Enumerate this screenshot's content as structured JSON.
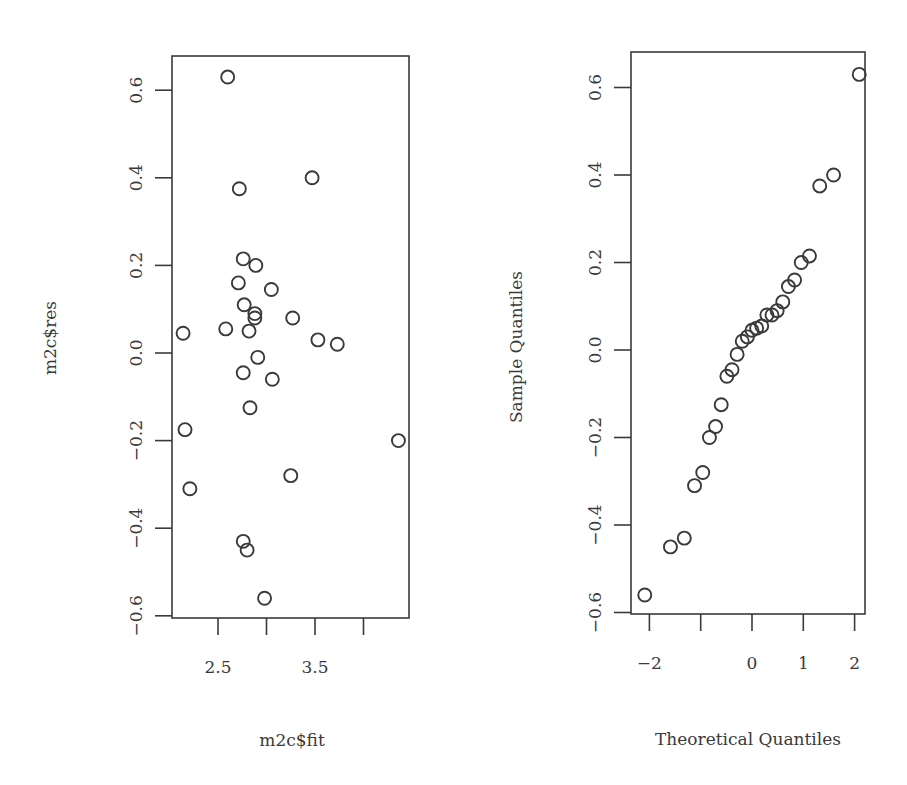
{
  "chart_data": [
    {
      "type": "scatter",
      "title": "",
      "xlabel": "m2c$fit",
      "ylabel": "m2c$res",
      "xlim": [
        2.05,
        4.5
      ],
      "ylim": [
        -0.6,
        0.67
      ],
      "x_ticks": [
        2.5,
        3.0,
        3.5,
        4.0
      ],
      "x_tick_labels": [
        "2.5",
        "",
        "3.5",
        ""
      ],
      "y_ticks": [
        -0.6,
        -0.4,
        -0.2,
        0.0,
        0.2,
        0.4,
        0.6
      ],
      "y_tick_labels": [
        "−0.6",
        "−0.4",
        "−0.2",
        "0.0",
        "0.2",
        "0.4",
        "0.6"
      ],
      "grid": false,
      "marker": "open-circle",
      "x": [
        2.6,
        2.72,
        3.47,
        2.76,
        2.89,
        2.71,
        3.05,
        2.77,
        2.88,
        2.88,
        3.27,
        2.58,
        2.82,
        2.14,
        3.53,
        3.73,
        2.91,
        2.76,
        3.06,
        2.83,
        2.16,
        4.36,
        3.25,
        2.21,
        2.76,
        2.8,
        2.98
      ],
      "y": [
        0.63,
        0.375,
        0.4,
        0.215,
        0.2,
        0.16,
        0.145,
        0.11,
        0.09,
        0.08,
        0.08,
        0.055,
        0.05,
        0.045,
        0.03,
        0.02,
        -0.01,
        -0.045,
        -0.06,
        -0.125,
        -0.175,
        -0.2,
        -0.28,
        -0.31,
        -0.43,
        -0.45,
        -0.56
      ]
    },
    {
      "type": "scatter",
      "title": "",
      "xlabel": "Theoretical Quantiles",
      "ylabel": "Sample Quantiles",
      "xlim": [
        -2.27,
        2.27
      ],
      "ylim": [
        -0.6,
        0.67
      ],
      "x_ticks": [
        -2,
        -1,
        0,
        1,
        2
      ],
      "x_tick_labels": [
        "−2",
        "",
        "0",
        "1",
        "2"
      ],
      "y_ticks": [
        -0.6,
        -0.4,
        -0.2,
        0.0,
        0.2,
        0.4,
        0.6
      ],
      "y_tick_labels": [
        "−0.6",
        "−0.4",
        "−0.2",
        "0.0",
        "0.2",
        "0.4",
        "0.6"
      ],
      "grid": false,
      "marker": "open-circle",
      "x": [
        -2.09,
        -1.59,
        -1.32,
        -1.12,
        -0.96,
        -0.83,
        -0.71,
        -0.6,
        -0.49,
        -0.39,
        -0.29,
        -0.19,
        -0.09,
        0.0,
        0.09,
        0.19,
        0.29,
        0.39,
        0.49,
        0.6,
        0.71,
        0.83,
        0.96,
        1.12,
        1.32,
        1.59,
        2.09
      ],
      "y": [
        -0.56,
        -0.45,
        -0.43,
        -0.31,
        -0.28,
        -0.2,
        -0.175,
        -0.125,
        -0.06,
        -0.045,
        -0.01,
        0.02,
        0.03,
        0.045,
        0.05,
        0.055,
        0.08,
        0.08,
        0.09,
        0.11,
        0.145,
        0.16,
        0.2,
        0.215,
        0.375,
        0.4,
        0.63
      ]
    }
  ],
  "panels": {
    "left": {
      "xlabel": "m2c$fit",
      "ylabel": "m2c$res"
    },
    "right": {
      "xlabel": "Theoretical Quantiles",
      "ylabel": "Sample Quantiles"
    }
  },
  "colors": {
    "ink": "#3a3a3a",
    "background": "#ffffff"
  }
}
